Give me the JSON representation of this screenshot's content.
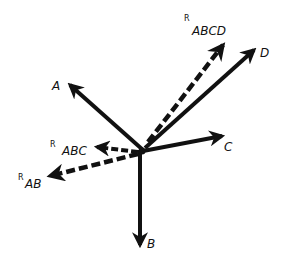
{
  "diagram": {
    "ink_color": "#111111",
    "vectors": [
      {
        "id": "A",
        "label": "A",
        "style": "solid"
      },
      {
        "id": "B",
        "label": "B",
        "style": "solid"
      },
      {
        "id": "C",
        "label": "C",
        "style": "solid"
      },
      {
        "id": "D",
        "label": "D",
        "style": "solid"
      },
      {
        "id": "R_AB",
        "label": "AB",
        "prefix": "R",
        "style": "dashed"
      },
      {
        "id": "R_ABC",
        "label": "ABC",
        "prefix": "R",
        "style": "dashed"
      },
      {
        "id": "R_ABCD",
        "label": "ABCD",
        "prefix": "R",
        "style": "dashed"
      }
    ]
  }
}
